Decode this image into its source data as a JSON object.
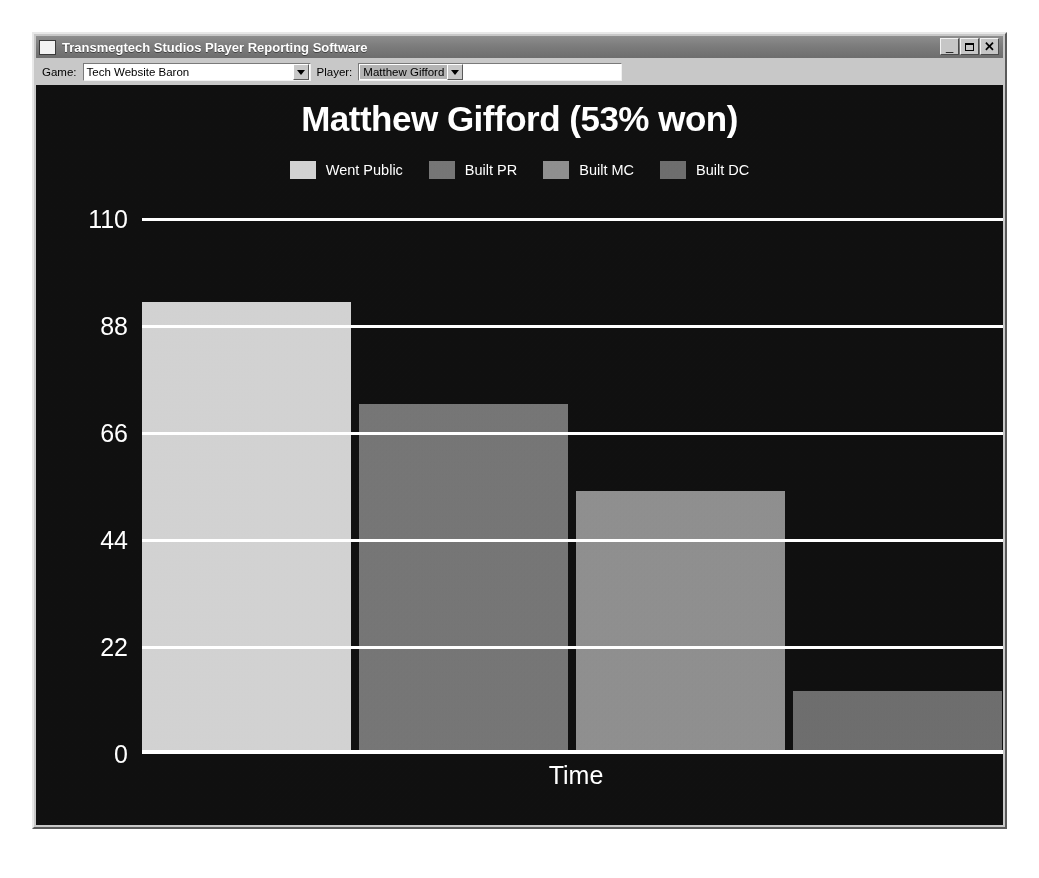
{
  "window": {
    "title": "Transmegtech Studios Player Reporting Software",
    "icon": "app-icon",
    "buttons": {
      "minimize": "_",
      "maximize": "□",
      "close": "✕"
    }
  },
  "toolbar": {
    "game_label": "Game:",
    "game_value": "Tech Website Baron",
    "player_label": "Player:",
    "player_value": "Matthew Gifford",
    "dropdown_icon": "chevron-down-icon"
  },
  "chart_data": {
    "type": "bar",
    "title": "Matthew Gifford (53% won)",
    "xlabel": "Time",
    "ylabel": "",
    "ylim": [
      0,
      110
    ],
    "yticks": [
      0,
      22,
      44,
      66,
      88,
      110
    ],
    "grid": true,
    "legend_position": "top",
    "categories": [
      "Went Public",
      "Built PR",
      "Built MC",
      "Built DC"
    ],
    "values": [
      93,
      72,
      54,
      13
    ],
    "colors": [
      "#d2d2d2",
      "#767676",
      "#8f8f8f",
      "#6e6e6e"
    ],
    "series": [
      {
        "name": "Went Public",
        "value": 93,
        "color": "#d2d2d2"
      },
      {
        "name": "Built PR",
        "value": 72,
        "color": "#767676"
      },
      {
        "name": "Built MC",
        "value": 54,
        "color": "#8f8f8f"
      },
      {
        "name": "Built DC",
        "value": 13,
        "color": "#6e6e6e"
      }
    ],
    "legend": [
      "Went Public",
      "Built PR",
      "Built MC",
      "Built DC"
    ],
    "background": "#101010",
    "foreground": "#ffffff"
  }
}
